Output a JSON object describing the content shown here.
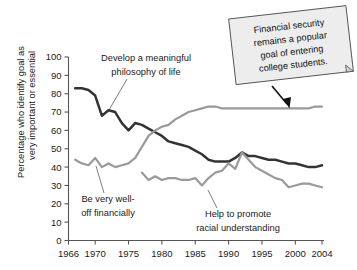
{
  "chart_data": {
    "type": "line",
    "title": "",
    "xlabel": "",
    "ylabel": "Percentage who identify goal as very important or essential",
    "ylabel_line1": "Percentage who identify goal as",
    "ylabel_line2": "very important or essential",
    "xlim": [
      1966,
      2004
    ],
    "ylim": [
      0,
      100
    ],
    "ytick_step": 10,
    "yticks": [
      "0",
      "10",
      "20",
      "30",
      "40",
      "50",
      "60",
      "70",
      "80",
      "90",
      "100"
    ],
    "xticks": [
      "1966",
      "1970",
      "1975",
      "1980",
      "1985",
      "1990",
      "1995",
      "2000",
      "2004"
    ],
    "grid": false,
    "legend_position": "inline-annotations",
    "series": [
      {
        "name": "Develop a meaningful philosophy of life",
        "color": "#333333",
        "x": [
          1967,
          1968,
          1969,
          1970,
          1971,
          1972,
          1973,
          1974,
          1975,
          1976,
          1977,
          1978,
          1979,
          1980,
          1981,
          1982,
          1983,
          1984,
          1985,
          1986,
          1987,
          1988,
          1989,
          1990,
          1991,
          1992,
          1993,
          1994,
          1995,
          1996,
          1997,
          1998,
          1999,
          2000,
          2001,
          2002,
          2003,
          2004
        ],
        "values": [
          83,
          83,
          82,
          79,
          68,
          71,
          70,
          64,
          60,
          64,
          63,
          61,
          59,
          57,
          54,
          53,
          52,
          51,
          49,
          47,
          44,
          43,
          43,
          43,
          45,
          48,
          46,
          46,
          45,
          44,
          44,
          43,
          42,
          42,
          41,
          40,
          40,
          41
        ]
      },
      {
        "name": "Be very well-off financially",
        "color": "#9a9a9a",
        "x": [
          1967,
          1968,
          1969,
          1970,
          1971,
          1972,
          1973,
          1974,
          1975,
          1976,
          1977,
          1978,
          1979,
          1980,
          1981,
          1982,
          1983,
          1984,
          1985,
          1986,
          1987,
          1988,
          1989,
          1990,
          1991,
          1992,
          1993,
          1994,
          1995,
          1996,
          1997,
          1998,
          1999,
          2000,
          2001,
          2002,
          2003,
          2004
        ],
        "values": [
          44,
          42,
          41,
          45,
          40,
          42,
          40,
          41,
          42,
          45,
          51,
          57,
          60,
          62,
          63,
          66,
          68,
          70,
          71,
          72,
          73,
          73,
          72,
          72,
          72,
          72,
          72,
          72,
          72,
          72,
          72,
          72,
          72,
          72,
          72,
          72,
          73,
          73
        ]
      },
      {
        "name": "Help to promote racial understanding",
        "color": "#9a9a9a",
        "x": [
          1977,
          1978,
          1979,
          1980,
          1981,
          1982,
          1983,
          1984,
          1985,
          1986,
          1987,
          1988,
          1989,
          1990,
          1991,
          1992,
          1993,
          1994,
          1995,
          1996,
          1997,
          1998,
          1999,
          2000,
          2001,
          2002,
          2003,
          2004
        ],
        "values": [
          37,
          33,
          35,
          33,
          34,
          34,
          33,
          33,
          34,
          30,
          34,
          37,
          38,
          42,
          39,
          48,
          44,
          40,
          38,
          36,
          34,
          33,
          29,
          30,
          31,
          31,
          30,
          29
        ]
      }
    ],
    "annotations": [
      {
        "name": "philosophy-label",
        "text_line1": "Develop a meaningful",
        "text_line2": "philosophy of life"
      },
      {
        "name": "financial-label",
        "text_line1": "Be very well-",
        "text_line2": "off financially"
      },
      {
        "name": "racial-label",
        "text_line1": "Help to promote",
        "text_line2": "racial understanding"
      }
    ],
    "callout": {
      "lines": [
        "Financial security",
        "remains a popular",
        "goal of entering",
        "college students."
      ],
      "points_to_series": "Be very well-off financially"
    }
  },
  "colors": {
    "dark_series": "#333333",
    "gray_series": "#9a9a9a",
    "axis": "#555555",
    "callout_fill": "#ededed",
    "callout_stroke": "#4a4a4a",
    "text": "#1a1a1a"
  }
}
